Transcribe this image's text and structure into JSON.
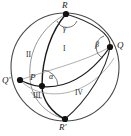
{
  "figure": {
    "kind": "spherical-geometry-diagram",
    "colors": {
      "background": "#ffffff",
      "outline": "#3a3a3a",
      "arc_light": "#6e6e6e",
      "arc_dark": "#1a1a1a",
      "point_fill": "#111111",
      "label": "#1a1a1a"
    },
    "sphere": {
      "cx": 65,
      "cy": 67,
      "r": 54
    },
    "points": [
      {
        "id": "R",
        "label": "R",
        "x": 66,
        "y": 14,
        "label_x": 62,
        "label_y": 2
      },
      {
        "id": "Q",
        "label": "Q",
        "x": 110,
        "y": 47,
        "label_x": 116,
        "label_y": 42
      },
      {
        "id": "Qp",
        "label": "Q'",
        "x": 20,
        "y": 80,
        "label_x": 3,
        "label_y": 76
      },
      {
        "id": "P",
        "label": "P",
        "x": 42,
        "y": 86,
        "label_x": 30,
        "label_y": 74
      },
      {
        "id": "Rp",
        "label": "R'",
        "x": 65,
        "y": 119,
        "label_x": 60,
        "label_y": 124
      }
    ],
    "angles": [
      {
        "id": "alpha",
        "label": "α",
        "vertex": "P",
        "label_x": 50,
        "label_y": 74
      },
      {
        "id": "beta",
        "label": "β",
        "vertex": "Q",
        "label_x": 96,
        "label_y": 42
      },
      {
        "id": "gamma",
        "label": "γ",
        "vertex": "R",
        "label_x": 63,
        "label_y": 26
      }
    ],
    "regions": [
      {
        "id": "I",
        "label": "I",
        "label_x": 63,
        "label_y": 48
      },
      {
        "id": "II",
        "label": "II",
        "label_x": 27,
        "label_y": 53
      },
      {
        "id": "III",
        "label": "III",
        "label_x": 34,
        "label_y": 94
      },
      {
        "id": "IV",
        "label": "IV",
        "label_x": 76,
        "label_y": 91
      }
    ]
  }
}
